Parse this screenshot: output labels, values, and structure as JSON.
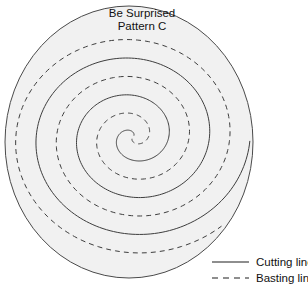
{
  "figure": {
    "title_line1": "Be Surprised",
    "title_line2": "Pattern C",
    "background_color": "#ffffff",
    "fabric_fill_color": "#f1f1f1",
    "line_color": "#3d3d3d"
  },
  "legend": {
    "items": [
      {
        "label": "Cutting line",
        "style": "solid",
        "icon": "solid-line-icon"
      },
      {
        "label": "Basting line",
        "style": "dashed",
        "icon": "dashed-line-icon"
      }
    ]
  },
  "chart_data": {
    "type": "line",
    "title": "Be Surprised Pattern C",
    "xlabel": "",
    "ylabel": "",
    "xlim": [
      0,
      308
    ],
    "ylim": [
      0,
      288
    ],
    "grid": false,
    "legend_position": "bottom-right",
    "disc": {
      "center_x": 129,
      "center_y": 142,
      "radius_x": 124,
      "radius_y": 136
    },
    "spiral": {
      "center_x": 133,
      "center_y": 137,
      "turns": 3.5,
      "arm_spacing_px": 37,
      "ellipse_aspect_ratio": 1.1,
      "start_angle_deg": -63,
      "outer_terminus_x": 223,
      "outer_terminus_y": 36
    },
    "series": [
      {
        "name": "Cutting line",
        "style": "solid",
        "crossings_horizontal_y142": [
          5,
          43,
          80,
          118,
          155,
          192,
          230
        ]
      },
      {
        "name": "Basting line",
        "style": "dashed",
        "crossings_horizontal_y142": [
          24,
          62,
          100,
          137,
          174,
          211
        ]
      }
    ]
  }
}
